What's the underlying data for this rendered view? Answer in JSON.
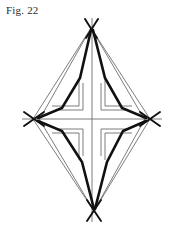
{
  "figure": {
    "caption": "Fig. 22",
    "type": "line-diagram",
    "colors": {
      "background": "#ffffff",
      "thin_line": "#6e6e6e",
      "thick_line": "#111111",
      "caption_text": "#2b2b2b"
    },
    "canvas": {
      "width": 176,
      "height": 226
    },
    "vertices": {
      "top": {
        "x": 91,
        "y": 28
      },
      "left": {
        "x": 33,
        "y": 119
      },
      "right": {
        "x": 150,
        "y": 119
      },
      "bottom": {
        "x": 94,
        "y": 211
      },
      "center": {
        "x": 92,
        "y": 119
      }
    },
    "overshoot_crosses": [
      {
        "name": "top-vertex-cross",
        "x": 91,
        "y": 28,
        "length": 12
      },
      {
        "name": "left-vertex-cross",
        "x": 33,
        "y": 119,
        "length": 11
      },
      {
        "name": "right-vertex-cross",
        "x": 150,
        "y": 119,
        "length": 11
      },
      {
        "name": "bottom-vertex-cross",
        "x": 94,
        "y": 211,
        "length": 12
      }
    ],
    "center_cross": {
      "name": "greek-cross-outline",
      "arm_half_width": 9,
      "arm_extent_x": 36,
      "arm_extent_y": 36
    },
    "axes": {
      "horizontal": {
        "x1": 22,
        "y1": 119,
        "x2": 162,
        "y2": 119
      },
      "vertical": {
        "x1": 92,
        "y1": 18,
        "x2": 92,
        "y2": 222
      }
    },
    "thin_edges": [
      {
        "name": "edge-top-left",
        "x1": 91,
        "y1": 28,
        "x2": 33,
        "y2": 119
      },
      {
        "name": "edge-top-right",
        "x1": 91,
        "y1": 28,
        "x2": 150,
        "y2": 119
      },
      {
        "name": "edge-bottom-left",
        "x1": 94,
        "y1": 211,
        "x2": 33,
        "y2": 119
      },
      {
        "name": "edge-bottom-right",
        "x1": 94,
        "y1": 211,
        "x2": 150,
        "y2": 119
      },
      {
        "name": "chord-top-left-inner",
        "x1": 91,
        "y1": 28,
        "x2": 38,
        "y2": 122
      },
      {
        "name": "chord-top-right-inner",
        "x1": 91,
        "y1": 28,
        "x2": 146,
        "y2": 122
      },
      {
        "name": "chord-bottom-left-inner",
        "x1": 94,
        "y1": 211,
        "x2": 38,
        "y2": 117
      },
      {
        "name": "chord-bottom-right-inner",
        "x1": 94,
        "y1": 211,
        "x2": 146,
        "y2": 117
      }
    ],
    "thick_paths": [
      {
        "name": "bent-path-upper-left",
        "points": "91,30 80,78 62,108 38,118"
      },
      {
        "name": "bent-path-upper-right",
        "points": "93,30 105,78 122,108 146,118"
      },
      {
        "name": "bent-path-lower-left",
        "points": "94,209 82,162 62,131 38,121"
      },
      {
        "name": "bent-path-lower-right",
        "points": "95,209 107,162 123,131 146,121"
      }
    ],
    "knee_nodes": [
      {
        "name": "knee-upper-left",
        "x": 80,
        "y": 78
      },
      {
        "name": "knee-upper-right",
        "x": 105,
        "y": 78
      },
      {
        "name": "knee-lower-left",
        "x": 82,
        "y": 162
      },
      {
        "name": "knee-lower-right",
        "x": 107,
        "y": 162
      },
      {
        "name": "elbow-upper-left",
        "x": 62,
        "y": 108
      },
      {
        "name": "elbow-upper-right",
        "x": 122,
        "y": 108
      },
      {
        "name": "elbow-lower-left",
        "x": 62,
        "y": 131
      },
      {
        "name": "elbow-lower-right",
        "x": 122,
        "y": 131
      }
    ]
  }
}
